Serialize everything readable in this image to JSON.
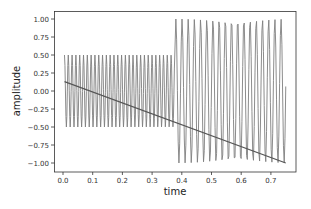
{
  "chart_data": {
    "type": "line",
    "title": "",
    "xlabel": "time",
    "ylabel": "amplitude",
    "xlim": [
      -0.03,
      0.785
    ],
    "ylim": [
      -1.1,
      1.1
    ],
    "xticks": [
      0.0,
      0.1,
      0.2,
      0.3,
      0.4,
      0.5,
      0.6,
      0.7
    ],
    "xtick_labels": [
      "0.0",
      "0.1",
      "0.2",
      "0.3",
      "0.4",
      "0.5",
      "0.6",
      "0.7"
    ],
    "yticks": [
      1.0,
      0.75,
      0.5,
      0.25,
      0.0,
      -0.25,
      -0.5,
      -0.75,
      -1.0
    ],
    "ytick_labels": [
      "1.00",
      "0.75",
      "0.50",
      "0.25",
      "0.00",
      "−0.25",
      "−0.50",
      "−0.75",
      "−1.00"
    ],
    "grid": false,
    "legend": null,
    "series": [
      {
        "name": "signal",
        "kind": "piecewise sinusoid",
        "color": "#7f7f7f",
        "segments": [
          {
            "t_start": 0.005,
            "t_end": 0.375,
            "amplitude": 0.5,
            "frequency_hz_approx": 78
          },
          {
            "t_start": 0.38,
            "t_end": 0.75,
            "amplitude": 1.0,
            "frequency_hz_approx": 48
          }
        ]
      },
      {
        "name": "trend",
        "kind": "straight line",
        "color": "#555555",
        "x": [
          0.005,
          0.75
        ],
        "y": [
          0.13,
          -1.0
        ]
      }
    ]
  }
}
